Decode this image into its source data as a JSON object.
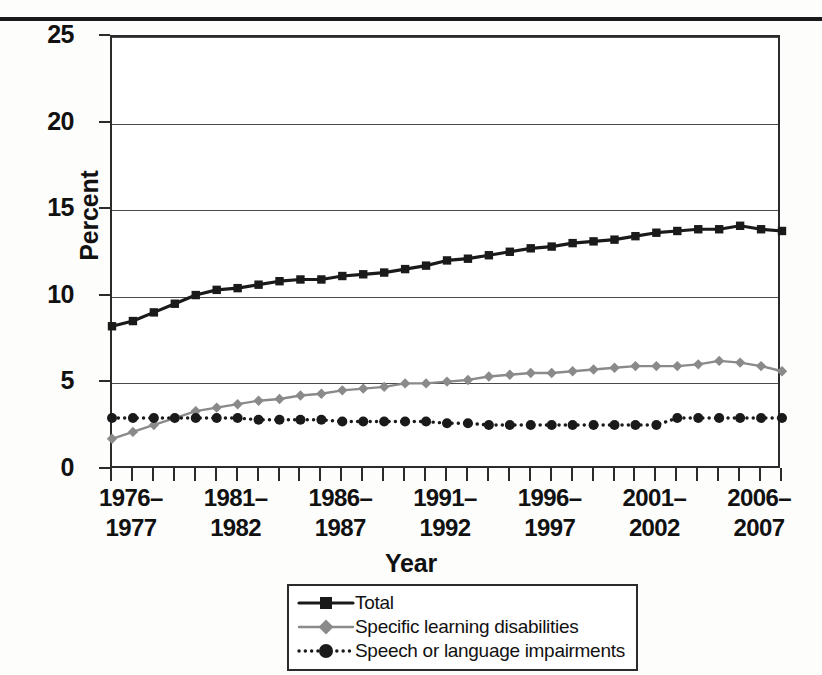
{
  "figure": {
    "y_axis_title": "Percent",
    "x_axis_title": "Year"
  },
  "legend": {
    "items": [
      {
        "label": "Total",
        "key": "total-key",
        "color": "#1a1a1a",
        "marker": "square",
        "style": "solid"
      },
      {
        "label": "Specific learning disabilities",
        "key": "sld-key",
        "color": "#8a8a8a",
        "marker": "diamond",
        "style": "solid"
      },
      {
        "label": "Speech or language impairments",
        "key": "sli-key",
        "color": "#1a1a1a",
        "marker": "circle",
        "style": "dotted"
      }
    ]
  },
  "chart_data": {
    "type": "line",
    "title": "",
    "xlabel": "Year",
    "ylabel": "Percent",
    "ylim": [
      0,
      25
    ],
    "yticks": [
      0,
      5,
      10,
      15,
      20,
      25
    ],
    "ytick_labels": [
      "0",
      "5",
      "10",
      "15",
      "20",
      "25"
    ],
    "grid": true,
    "legend_position": "bottom-center",
    "x_tick_labels": [
      {
        "index": 1,
        "line1": "1976–",
        "line2": "1977"
      },
      {
        "index": 6,
        "line1": "1981–",
        "line2": "1982"
      },
      {
        "index": 11,
        "line1": "1986–",
        "line2": "1987"
      },
      {
        "index": 16,
        "line1": "1991–",
        "line2": "1992"
      },
      {
        "index": 21,
        "line1": "1996–",
        "line2": "1997"
      },
      {
        "index": 26,
        "line1": "2001–",
        "line2": "2002"
      },
      {
        "index": 31,
        "line1": "2006–",
        "line2": "2007"
      }
    ],
    "x": [
      "1975-1976",
      "1976-1977",
      "1977-1978",
      "1978-1979",
      "1979-1980",
      "1980-1981",
      "1981-1982",
      "1982-1983",
      "1983-1984",
      "1984-1985",
      "1985-1986",
      "1986-1987",
      "1987-1988",
      "1988-1989",
      "1989-1990",
      "1990-1991",
      "1991-1992",
      "1992-1993",
      "1993-1994",
      "1994-1995",
      "1995-1996",
      "1996-1997",
      "1997-1998",
      "1998-1999",
      "1999-2000",
      "2000-2001",
      "2001-2002",
      "2002-2003",
      "2003-2004",
      "2004-2005",
      "2005-2006",
      "2006-2007",
      "2007-2008"
    ],
    "series": [
      {
        "name": "Total",
        "color": "#1a1a1a",
        "marker": "square",
        "style": "solid",
        "values": [
          8.3,
          8.6,
          9.1,
          9.6,
          10.1,
          10.4,
          10.5,
          10.7,
          10.9,
          11.0,
          11.0,
          11.2,
          11.3,
          11.4,
          11.6,
          11.8,
          12.1,
          12.2,
          12.4,
          12.6,
          12.8,
          12.9,
          13.1,
          13.2,
          13.3,
          13.5,
          13.7,
          13.8,
          13.9,
          13.9,
          14.1,
          13.9,
          13.8
        ]
      },
      {
        "name": "Specific learning disabilities",
        "color": "#8a8a8a",
        "marker": "diamond",
        "style": "solid",
        "values": [
          1.8,
          2.2,
          2.6,
          3.0,
          3.4,
          3.6,
          3.8,
          4.0,
          4.1,
          4.3,
          4.4,
          4.6,
          4.7,
          4.8,
          5.0,
          5.0,
          5.1,
          5.2,
          5.4,
          5.5,
          5.6,
          5.6,
          5.7,
          5.8,
          5.9,
          6.0,
          6.0,
          6.0,
          6.1,
          6.3,
          6.2,
          6.0,
          5.7
        ]
      },
      {
        "name": "Speech or language impairments",
        "color": "#1a1a1a",
        "marker": "circle",
        "style": "dotted",
        "values": [
          3.0,
          3.0,
          3.0,
          3.0,
          3.0,
          3.0,
          3.0,
          2.9,
          2.9,
          2.9,
          2.9,
          2.8,
          2.8,
          2.8,
          2.8,
          2.8,
          2.7,
          2.7,
          2.6,
          2.6,
          2.6,
          2.6,
          2.6,
          2.6,
          2.6,
          2.6,
          2.6,
          3.0,
          3.0,
          3.0,
          3.0,
          3.0,
          3.0
        ]
      }
    ]
  }
}
